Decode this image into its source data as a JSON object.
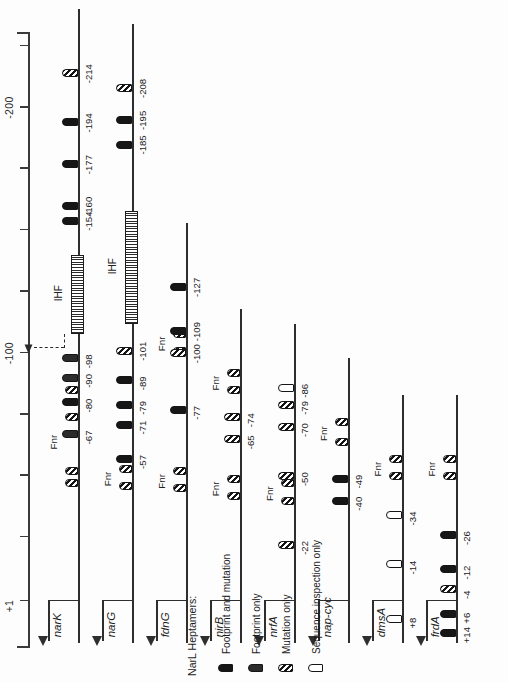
{
  "figure": {
    "axis": {
      "label_top": "+1",
      "label_mid": "-100",
      "label_bottom": "-200",
      "ticks": [
        1,
        -25,
        -50,
        -75,
        -100,
        -125,
        -150,
        -175,
        -200,
        -225
      ],
      "range": [
        20,
        -230
      ]
    },
    "marker_colors": {
      "footprint_and_mutation": "#161616",
      "footprint_only": "#2c2c2c",
      "mutation_only": "#151515",
      "sequence_inspection_only": "#ffffff",
      "line": "#2e2e2e"
    },
    "legend": {
      "title": "NarL Heptamers:",
      "items": [
        {
          "label": "Footprint and mutation",
          "style": "filled"
        },
        {
          "label": "Footprint only",
          "style": "foot"
        },
        {
          "label": "Mutation only",
          "style": "mut"
        },
        {
          "label": "Sequence inspection only",
          "style": "seq"
        }
      ]
    },
    "tracks": [
      {
        "gene": "narK",
        "fnr_label": "Fnr",
        "ihf_label": "IHF",
        "ihf_start": -108,
        "ihf_end": -140,
        "fnr_sites": [
          -47,
          -52,
          -74,
          -85
        ],
        "bend_arrow": true,
        "sites": [
          {
            "pos": -67,
            "label": "-67",
            "style": "foot"
          },
          {
            "pos": -80,
            "label": "-80",
            "style": "filled"
          },
          {
            "pos": -90,
            "label": "-90",
            "style": "foot"
          },
          {
            "pos": -98,
            "label": "-98",
            "style": "foot"
          },
          {
            "pos": -154,
            "label": "-154",
            "style": "filled"
          },
          {
            "pos": -160,
            "label": "-160",
            "style": "filled"
          },
          {
            "pos": -177,
            "label": "-177",
            "style": "filled"
          },
          {
            "pos": -194,
            "label": "-194",
            "style": "filled"
          },
          {
            "pos": -214,
            "label": "-214",
            "style": "mut"
          }
        ]
      },
      {
        "gene": "narG",
        "fnr_label": "Fnr",
        "ihf_label": "IHF",
        "ihf_start": -112,
        "ihf_end": -158,
        "fnr_sites": [
          -46,
          -53
        ],
        "bend_arrow": false,
        "sites": [
          {
            "pos": -57,
            "label": "-57",
            "style": "filled"
          },
          {
            "pos": -71,
            "label": "-71",
            "style": "filled"
          },
          {
            "pos": -79,
            "label": "-79",
            "style": "filled"
          },
          {
            "pos": -89,
            "label": "-89",
            "style": "filled"
          },
          {
            "pos": -101,
            "label": "-101",
            "style": "mut"
          },
          {
            "pos": -185,
            "label": "-185",
            "style": "filled"
          },
          {
            "pos": -195,
            "label": "-195",
            "style": "filled"
          },
          {
            "pos": -208,
            "label": "-208",
            "style": "mut"
          }
        ]
      },
      {
        "gene": "fdnG",
        "fnr_label": "Fnr",
        "fnr_label2": "Fnr",
        "fnr_sites": [
          -45,
          -52
        ],
        "fnr_sites2": [
          -101,
          -108
        ],
        "sites": [
          {
            "pos": -77,
            "label": "-77",
            "style": "filled"
          },
          {
            "pos": -100,
            "label": "-100",
            "style": "mut"
          },
          {
            "pos": -109,
            "label": "-109",
            "style": "filled"
          },
          {
            "pos": -127,
            "label": "-127",
            "style": "filled"
          }
        ]
      },
      {
        "gene": "nirB",
        "fnr_label": "Fnr",
        "fnr_label2": "Fnr",
        "fnr_sites": [
          -42,
          -49
        ],
        "fnr_sites2": [
          -85,
          -92
        ],
        "sites": [
          {
            "pos": -65,
            "label": "-65",
            "style": "mut"
          },
          {
            "pos": -74,
            "label": "-74",
            "style": "mut"
          }
        ]
      },
      {
        "gene": "nrfA",
        "fnr_label": "Fnr",
        "fnr_sites": [
          -40,
          -47
        ],
        "sites": [
          {
            "pos": -22,
            "label": "-22",
            "style": "mut"
          },
          {
            "pos": -50,
            "label": "-50",
            "style": "mut"
          },
          {
            "pos": -70,
            "label": "-70",
            "style": "mut"
          },
          {
            "pos": -79,
            "label": "-79",
            "style": "mut"
          },
          {
            "pos": -86,
            "label": "-86",
            "style": "seq"
          }
        ]
      },
      {
        "gene": "nap-cyc",
        "fnr_label": "Fnr",
        "fnr_sites": [
          -64,
          -72
        ],
        "sites": [
          {
            "pos": -40,
            "label": "-40",
            "style": "filled"
          },
          {
            "pos": -49,
            "label": "-49",
            "style": "filled"
          }
        ]
      },
      {
        "gene": "dmsA",
        "fnr_label": "Fnr",
        "fnr_sites": [
          -50,
          -57
        ],
        "sites": [
          {
            "pos": 8,
            "label": "+8",
            "style": "seq"
          },
          {
            "pos": -14,
            "label": "-14",
            "style": "seq"
          },
          {
            "pos": -34,
            "label": "-34",
            "style": "seq"
          }
        ]
      },
      {
        "gene": "frdA",
        "fnr_label": "Fnr",
        "fnr_sites": [
          -50,
          -57
        ],
        "sites": [
          {
            "pos": 14,
            "label": "+14",
            "style": "filled"
          },
          {
            "pos": 6,
            "label": "+6",
            "style": "filled"
          },
          {
            "pos": -4,
            "label": "-4",
            "style": "mut"
          },
          {
            "pos": -12,
            "label": "-12",
            "style": "filled"
          },
          {
            "pos": -26,
            "label": "-26",
            "style": "filled"
          }
        ]
      }
    ]
  }
}
